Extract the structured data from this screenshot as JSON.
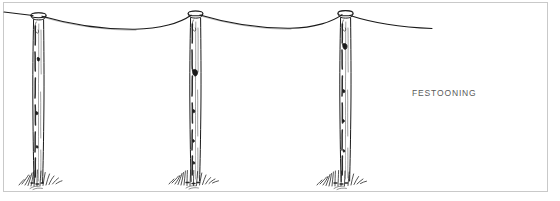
{
  "figure": {
    "name": "festooning-illustration",
    "caption": "FESTOONING",
    "background_color": "#ffffff",
    "ink_color": "#1a1a1a",
    "caption_color": "#5a5a5a",
    "frame": {
      "border_color": "#c9c9c9",
      "x": 3,
      "y": 2,
      "width": 545,
      "height": 190
    },
    "wire": {
      "label": "festooned wire",
      "color": "#1a1a1a",
      "start_x": 4,
      "end_x": 432,
      "attach_y": 17,
      "sag_depth_px": 11
    },
    "posts": [
      {
        "label": "post-left",
        "x": 38,
        "top_y": 15,
        "base_y": 182,
        "cap": true
      },
      {
        "label": "post-center",
        "x": 195,
        "top_y": 13,
        "base_y": 180,
        "cap": true
      },
      {
        "label": "post-right",
        "x": 345,
        "top_y": 13,
        "base_y": 180,
        "cap": true
      }
    ],
    "grass_tufts": [
      {
        "label": "grass-left",
        "x": 38,
        "y": 182
      },
      {
        "label": "grass-center",
        "x": 195,
        "y": 180
      },
      {
        "label": "grass-right",
        "x": 345,
        "y": 180
      }
    ]
  }
}
